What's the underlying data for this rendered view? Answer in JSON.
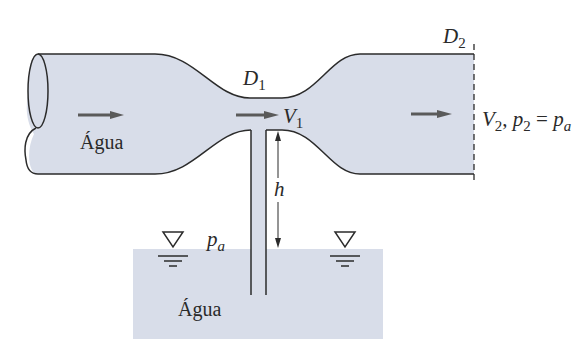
{
  "figure": {
    "type": "venturi-siphon-diagram",
    "colors": {
      "water_fill": "#d8dde9",
      "outline": "#2b2b2b",
      "arrow": "#5a5a5a",
      "text": "#2a2a2a",
      "background": "#ffffff"
    }
  },
  "labels": {
    "inlet_fluid": "Água",
    "reservoir_fluid": "Água",
    "throat_diameter": {
      "main": "D",
      "sub": "1"
    },
    "outlet_diameter": {
      "main": "D",
      "sub": "2"
    },
    "throat_velocity": {
      "main": "V",
      "sub": "1"
    },
    "outlet_conditions": {
      "v_main": "V",
      "v_sub": "2",
      "sep": ", ",
      "p_main": "p",
      "p_sub": "2",
      "eq": " = ",
      "pa_main": "p",
      "pa_sub": "a"
    },
    "atmospheric_pressure": {
      "main": "p",
      "sub": "a"
    },
    "height": "h"
  },
  "symbols": {
    "free_surface_left": "free-surface-symbol",
    "free_surface_right": "free-surface-symbol"
  }
}
